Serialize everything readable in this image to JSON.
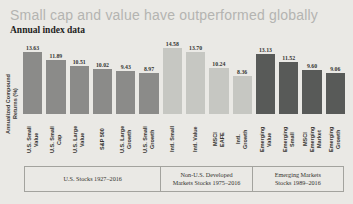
{
  "title": "Small cap and value have outperformed globally",
  "subtitle": "Annual index data",
  "y_axis_label": "Annualized Compound\nReturns (%)",
  "colors": {
    "page_background": "#eae9e5",
    "title_text": "#b4b4b1",
    "us_bars": "#8b8b89",
    "intl_bars": "#c6c7c2",
    "emerging_bars": "#585a58",
    "group_box_border": "#a3a39e"
  },
  "chart_data": {
    "type": "bar",
    "title": "Small cap and value have outperformed globally",
    "subtitle": "Annual index data",
    "ylabel": "Annualized Compound Returns (%)",
    "ylim": [
      0,
      15
    ],
    "grid": false,
    "legend": "none",
    "groups": [
      {
        "label": "U.S. Stocks 1927–2016",
        "color": "#8b8b89",
        "bars": [
          {
            "category": "U.S. Small\nValue",
            "value": 13.63
          },
          {
            "category": "U.S. Small\nCap",
            "value": 11.89
          },
          {
            "category": "U.S. Large\nValue",
            "value": 10.51
          },
          {
            "category": "S&P 500",
            "value": 10.02
          },
          {
            "category": "U.S. Large\nGrowth",
            "value": 9.43
          },
          {
            "category": "U.S. Small\nGrowth",
            "value": 8.97
          }
        ]
      },
      {
        "label": "Non-U.S. Developed\nMarkets Stocks 1975–2016",
        "color": "#c6c7c2",
        "bars": [
          {
            "category": "Intl. Small",
            "value": 14.58
          },
          {
            "category": "Intl. Value",
            "value": 13.7
          },
          {
            "category": "MSCI\nEAFE",
            "value": 10.24
          },
          {
            "category": "Intl.\nGrowth",
            "value": 8.36
          }
        ]
      },
      {
        "label": "Emerging Markets\nStocks 1989–2016",
        "color": "#585a58",
        "bars": [
          {
            "category": "Emerging\nValue",
            "value": 13.13
          },
          {
            "category": "Emerging\nSmall",
            "value": 11.52
          },
          {
            "category": "MSCI\nEmerging\nMarket",
            "value": 9.6
          },
          {
            "category": "Emerging\nGrowth",
            "value": 9.06
          }
        ]
      }
    ]
  }
}
